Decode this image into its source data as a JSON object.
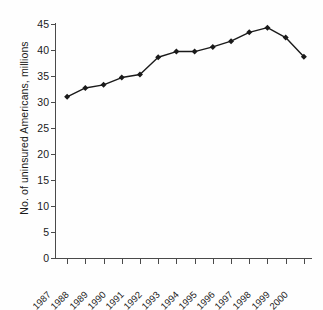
{
  "chart_data": {
    "type": "line",
    "title": "",
    "subtitle": "",
    "xlabel": "",
    "ylabel": "No. of uninsured Americans, millions",
    "categories": [
      "1987",
      "1988",
      "1989",
      "1990",
      "1991",
      "1992",
      "1993",
      "1994",
      "1995",
      "1996",
      "1997",
      "1998",
      "1999",
      "2000"
    ],
    "values": [
      31.0,
      32.7,
      33.3,
      34.7,
      35.3,
      38.6,
      39.7,
      39.7,
      40.6,
      41.7,
      43.4,
      44.3,
      42.4,
      38.7
    ],
    "series": [
      {
        "name": "No. of uninsured Americans",
        "values": [
          31.0,
          32.7,
          33.3,
          34.7,
          35.3,
          38.6,
          39.7,
          39.7,
          40.6,
          41.7,
          43.4,
          44.3,
          42.4,
          38.7
        ]
      }
    ],
    "ylim": [
      0,
      45
    ],
    "ytick_labels": [
      "0",
      "5",
      "10",
      "15",
      "20",
      "25",
      "30",
      "35",
      "40",
      "45"
    ],
    "ytick_values": [
      0,
      5,
      10,
      15,
      20,
      25,
      30,
      35,
      40,
      45
    ],
    "grid": false,
    "legend": "none",
    "marker": "diamond",
    "line_color": "#1a1a1a",
    "marker_color": "#1a1a1a",
    "axis_color": "#4a4a4a",
    "background_color": "#ffffff",
    "xtick_rotation": -45
  }
}
